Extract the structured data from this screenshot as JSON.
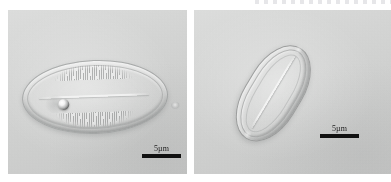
{
  "figure": {
    "kind": "light-microscopy-figure",
    "background_color": "#ffffff",
    "panel_count": 2,
    "modality": "differential interference contrast light micrograph"
  },
  "panels": [
    {
      "id": "panel-left",
      "position": "left",
      "field_color": "#d2d3d2",
      "specimen": {
        "name": "elliptical-diatom-valve",
        "description": "broadly elliptical diatom frustule in valve view with fine transverse striae along both margins",
        "orientation": "horizontal",
        "features": [
          "striae",
          "axial raphe",
          "refractile inclusion"
        ]
      },
      "scalebar": {
        "label": "5µm",
        "bar_color": "#111111",
        "length_px": 39
      }
    },
    {
      "id": "panel-right",
      "position": "right",
      "field_color": "#d2d3d2",
      "specimen": {
        "name": "lanceolate-diatom-valve",
        "description": "narrow lanceolate diatom frustule tilted diagonally, showing thick refractive valve outlines and a central raphe",
        "orientation": "diagonal",
        "features": [
          "valve outline",
          "axial raphe",
          "apices"
        ]
      },
      "scalebar": {
        "label": "5µm",
        "bar_color": "#111111",
        "length_px": 39
      }
    }
  ]
}
